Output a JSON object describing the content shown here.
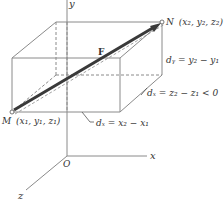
{
  "figure": {
    "axes": {
      "x_label": "x",
      "y_label": "y",
      "z_label": "z",
      "origin_label": "O"
    },
    "points": {
      "M": {
        "name": "M",
        "coords": "(x₁, y₁, z₁)"
      },
      "N": {
        "name": "N",
        "coords": "(x₂, y₂, z₂)"
      }
    },
    "vector_label": "F",
    "dimensions": {
      "dx": "dₓ = x₂ − x₁",
      "dy": "dᵧ = y₂ − y₁",
      "dz": "dₓ = z₂ − z₁ < 0"
    },
    "colors": {
      "line": "#8a8a8a",
      "vector": "#3a3a3a",
      "text": "#333333"
    }
  }
}
